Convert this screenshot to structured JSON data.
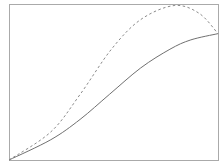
{
  "chart_data": {
    "type": "line",
    "title": "",
    "xlabel": "",
    "ylabel": "",
    "xlim": [
      0,
      1
    ],
    "ylim": [
      0,
      1
    ],
    "grid": false,
    "legend": null,
    "x": [
      0,
      0.2,
      0.34,
      0.48,
      0.63,
      0.77,
      0.87,
      1.0
    ],
    "series": [
      {
        "name": "solid",
        "style": "solid",
        "color": "#707070",
        "values": [
          0,
          0.13,
          0.26,
          0.42,
          0.59,
          0.71,
          0.77,
          0.81
        ]
      },
      {
        "name": "dashed",
        "style": "dashed",
        "color": "#8a8a8a",
        "x": [
          0,
          0.2,
          0.34,
          0.49,
          0.63,
          0.79,
          0.91,
          1.0
        ],
        "values": [
          0,
          0.18,
          0.42,
          0.71,
          0.9,
          0.99,
          0.94,
          0.81
        ]
      }
    ]
  },
  "layout": {
    "frame": {
      "left": 9,
      "top": 4,
      "right": 218,
      "bottom": 160,
      "color": "#aaaaaa"
    }
  }
}
